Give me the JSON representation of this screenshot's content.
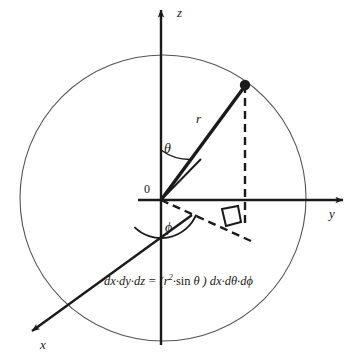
{
  "figure": {
    "width": 357,
    "height": 362,
    "background_color": "#ffffff",
    "ink_color": "#1a1a1a",
    "sphere_outline_color": "#555555"
  },
  "labels": {
    "z_axis": "z",
    "y_axis": "y",
    "x_axis": "x",
    "origin": "0",
    "radius": "r",
    "polar_angle": "θ",
    "azimuthal_angle": "ϕ"
  },
  "formula": {
    "lhs": "dx·dy·dz",
    "equals": "=",
    "open_paren": "(",
    "r_symbol": "r",
    "r_exponent": "2",
    "middot": "·",
    "sin": "sin",
    "theta": "θ",
    "close_paren": ")",
    "rhs": "dx·dθ·dϕ",
    "full_text": "dx·dy·dz = (r²·sin θ ) dx·dθ·dϕ"
  },
  "geometry": {
    "origin": {
      "x": 161,
      "y": 200
    },
    "sphere": {
      "cx": 163,
      "cy": 198,
      "r": 143
    },
    "point": {
      "x": 245,
      "y": 85,
      "dot_radius": 5.2
    },
    "z_axis": {
      "x1": 161,
      "y1": 345,
      "x2": 161,
      "y2": 8
    },
    "y_axis": {
      "x1": 138,
      "y1": 200,
      "x2": 345,
      "y2": 200
    },
    "x_axis": {
      "x1": 190,
      "y1": 217,
      "x2": 30,
      "y2": 333
    },
    "projection_dashed": {
      "x1": 161,
      "y1": 200,
      "x2": 251,
      "y2": 241
    },
    "drop_dashed": {
      "x1": 245,
      "y1": 85,
      "x2": 245,
      "y2": 223
    },
    "helper_line": {
      "x1": 161,
      "y1": 200,
      "x2": 200,
      "y2": 160
    },
    "theta_arc_radius": 50,
    "phi_arc_radius": 38
  },
  "label_positions": {
    "z": {
      "left": 177,
      "top": 6
    },
    "y": {
      "left": 329,
      "top": 207
    },
    "x": {
      "left": 40,
      "top": 338
    },
    "origin": {
      "left": 144,
      "top": 183
    },
    "r": {
      "left": 196,
      "top": 112
    },
    "theta": {
      "left": 164,
      "top": 142
    },
    "phi": {
      "left": 165,
      "top": 221
    }
  }
}
